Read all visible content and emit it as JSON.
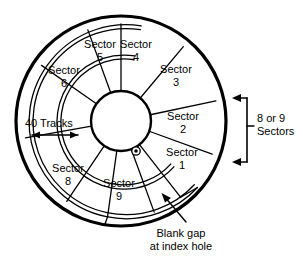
{
  "diagram": {
    "background_color": "#ffffff",
    "line_color": "#000000",
    "geometry": {
      "center_x": 121,
      "center_y": 121,
      "disk_outer_radius": 105,
      "track_band_outer_r1": 97,
      "track_band_outer_r2": 93,
      "track_band_inner_r1": 67,
      "track_band_inner_r2": 63,
      "hub_radius": 30,
      "sector_count": 9
    },
    "sectors": [
      {
        "name": "Sector",
        "number": "1",
        "label_x": 182,
        "label_y": 156
      },
      {
        "name": "Sector",
        "number": "2",
        "label_x": 183,
        "label_y": 120
      },
      {
        "name": "Sector",
        "number": "3",
        "label_x": 175,
        "label_y": 73
      },
      {
        "name": "Sector",
        "number": "4",
        "label_x": 135,
        "label_y": 47
      },
      {
        "name": "Sector",
        "number": "5",
        "label_x": 99,
        "label_y": 48
      },
      {
        "name": "Sector",
        "number": "6",
        "label_x": 63,
        "label_y": 74
      },
      {
        "name": "Sector",
        "number": "8",
        "label_x": 67,
        "label_y": 172
      },
      {
        "name": "Sector",
        "number": "9",
        "label_x": 117,
        "label_y": 186
      }
    ],
    "annotations": {
      "tracks": {
        "label": "40 Tracks",
        "x": 28,
        "y": 124
      },
      "sectors_bracket": {
        "line1": "8 or 9",
        "line2": "Sectors",
        "x": 258,
        "y": 118
      },
      "blank_gap": {
        "line1": "Blank gap",
        "line2": "at index hole",
        "x": 181,
        "y": 237
      }
    },
    "index_hole": {
      "name": "index-hole",
      "cx": 136,
      "cy": 151,
      "r": 4
    }
  }
}
